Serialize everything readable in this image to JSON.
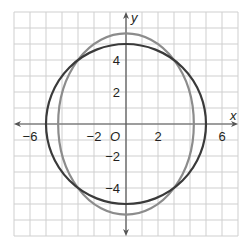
{
  "chart_data": {
    "type": "line",
    "title": "",
    "xlabel": "x",
    "ylabel": "y",
    "origin_label": "O",
    "xlim": [
      -7,
      7
    ],
    "ylim": [
      -7,
      7
    ],
    "grid": true,
    "x_ticks": [
      -6,
      -2,
      2,
      6
    ],
    "x_tick_labels": [
      "−6",
      "−2",
      "2",
      "6"
    ],
    "y_ticks": [
      4,
      2,
      -2,
      -4
    ],
    "y_tick_labels": [
      "4",
      "2",
      "−2",
      "−4"
    ],
    "series": [
      {
        "name": "circle",
        "shape": "circle",
        "center": [
          0,
          0
        ],
        "radius": 5,
        "equation": "x^2 + y^2 = 25",
        "color": "#3a3a3a"
      },
      {
        "name": "ellipse",
        "shape": "ellipse",
        "center": [
          0,
          0
        ],
        "semi_x": 4.24,
        "semi_y": 5.66,
        "equation": "x^2/18 + y^2/32 = 1",
        "color": "#8c8c8c"
      }
    ],
    "intersections_approx": [
      [
        3.6,
        3.5
      ],
      [
        -3.6,
        3.5
      ],
      [
        3.6,
        -3.5
      ],
      [
        -3.6,
        -3.5
      ]
    ]
  },
  "colors": {
    "grid": "#cfcfcf",
    "axis": "#555555",
    "circle": "#3a3a3a",
    "ellipse": "#8c8c8c"
  }
}
